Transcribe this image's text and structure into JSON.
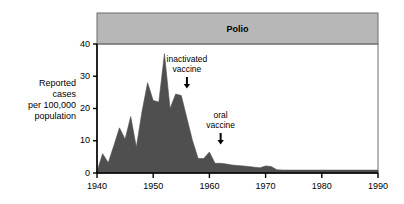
{
  "chart_data": {
    "type": "area",
    "title": "Polio",
    "xlabel": "",
    "ylabel": "Reported\ncases\nper 100,000\npopulation",
    "xlim": [
      1940,
      1990
    ],
    "ylim": [
      0,
      40
    ],
    "xticks": [
      "1940",
      "1950",
      "1960",
      "1970",
      "1980",
      "1990"
    ],
    "xtick_values": [
      1940,
      1950,
      1960,
      1970,
      1980,
      1990
    ],
    "yticks": [
      "0",
      "10",
      "20",
      "30",
      "40"
    ],
    "ytick_values": [
      0,
      10,
      20,
      30,
      40
    ],
    "grid": false,
    "legend": "none",
    "series_name": "Reported polio cases per 100,000 population",
    "x": [
      1940,
      1941,
      1942,
      1943,
      1944,
      1945,
      1946,
      1947,
      1948,
      1949,
      1950,
      1951,
      1952,
      1953,
      1954,
      1955,
      1956,
      1957,
      1958,
      1959,
      1960,
      1961,
      1962,
      1963,
      1964,
      1965,
      1966,
      1967,
      1968,
      1969,
      1970,
      1971,
      1972,
      1973,
      1974,
      1975,
      1976,
      1977,
      1978,
      1979,
      1980,
      1981,
      1982,
      1983,
      1984,
      1985,
      1986,
      1987,
      1988,
      1989,
      1990
    ],
    "values": [
      0.5,
      6.0,
      3.2,
      8.5,
      14.0,
      10.5,
      17.5,
      8.0,
      19.0,
      28.0,
      22.5,
      22.0,
      37.0,
      20.0,
      24.5,
      24.0,
      17.0,
      10.0,
      4.5,
      4.5,
      6.5,
      3.0,
      3.0,
      2.8,
      2.5,
      2.3,
      2.2,
      2.0,
      1.8,
      1.6,
      2.2,
      2.0,
      1.0,
      0.9,
      0.9,
      0.9,
      0.9,
      0.9,
      0.9,
      0.9,
      0.9,
      0.9,
      0.9,
      0.9,
      0.9,
      0.9,
      0.9,
      0.9,
      0.9,
      0.9,
      0.9
    ],
    "annotations": [
      {
        "id": "inactivated-vaccine",
        "label": "inactivated\nvaccine",
        "x": 1956,
        "arrow": "down"
      },
      {
        "id": "oral-vaccine",
        "label": "oral\nvaccine",
        "x": 1962,
        "arrow": "down"
      }
    ],
    "colors": {
      "area_fill": "#4f4f4f",
      "banner_fill": "#b7b7b7",
      "axis": "#000000",
      "frame": "#6d6d6d",
      "background": "#ffffff"
    }
  }
}
